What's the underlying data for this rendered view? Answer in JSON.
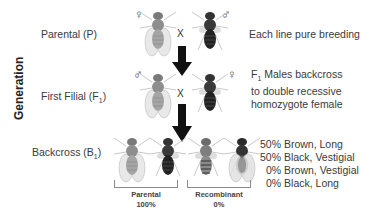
{
  "axis_label": "Generation",
  "rows": [
    {
      "label": "Parental (P)",
      "description": [
        "Each line pure breeding"
      ]
    },
    {
      "label": "First Filial (F",
      "label_sub": "1",
      "label_end": ")",
      "description_prefix": "F",
      "description_sub": "1",
      "description": [
        " Males backcross",
        "to double recessive",
        "homozygote female"
      ]
    },
    {
      "label": "Backcross (B",
      "label_sub": "1",
      "label_end": ")"
    }
  ],
  "cross_symbol": "X",
  "sex_symbols": {
    "female": "♀",
    "male": "♂"
  },
  "groups": [
    {
      "title": "Parental",
      "value": "100%"
    },
    {
      "title": "Recombinant",
      "value": "0%"
    }
  ],
  "results": [
    "50% Brown, Long",
    "50% Black, Vestigial",
    "0% Brown, Vestigial",
    "0% Black, Long"
  ],
  "colors": {
    "brown_fly": "#8c8c8c",
    "black_fly": "#2e2e2e",
    "arrow": "#111111"
  }
}
